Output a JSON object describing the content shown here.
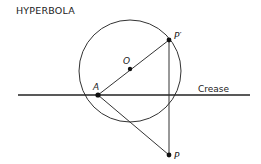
{
  "title": "HYPERBOLA",
  "colors": {
    "ink": "#222222",
    "background": "#ffffff"
  },
  "labels": {
    "crease": "Crease",
    "point_o": "O",
    "point_a": "A",
    "point_p_prime": "P′",
    "point_p": "P"
  },
  "geometry": {
    "circle": {
      "cx": 130,
      "cy": 71,
      "r": 51
    },
    "crease_line": {
      "x1": 18,
      "y1": 95,
      "x2": 250,
      "y2": 95
    },
    "points": {
      "O": {
        "x": 130,
        "y": 69
      },
      "A": {
        "x": 98,
        "y": 95
      },
      "P_prime": {
        "x": 169,
        "y": 40
      },
      "P": {
        "x": 169,
        "y": 155
      }
    },
    "segments": [
      {
        "from": "A",
        "to": "P_prime"
      },
      {
        "from": "A",
        "to": "P"
      },
      {
        "from": "P_prime",
        "to": "P"
      }
    ]
  }
}
